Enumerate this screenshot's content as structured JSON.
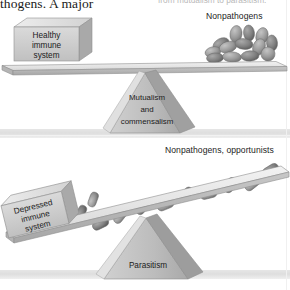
{
  "figure": {
    "caption_left": "thogens. A major",
    "caption_right": "from mutualism to parasitism."
  },
  "panels": [
    {
      "id": "panel-top",
      "state": "balanced",
      "left_block": {
        "lines": [
          "Healthy",
          "immune",
          "system"
        ],
        "text": "Healthy immune system"
      },
      "right_label": "Nonpathogens",
      "fulcrum": {
        "lines": [
          "Mutualism",
          "and",
          "commensalism"
        ],
        "text": "Mutualism and commensalism"
      },
      "microbes": {
        "shape": "coccobacilli-pile",
        "count": 13
      }
    },
    {
      "id": "panel-bottom",
      "state": "tipped-left",
      "left_block": {
        "lines": [
          "Depressed",
          "immune",
          "system"
        ],
        "text": "Depressed immune system"
      },
      "right_label": "Nonpathogens, opportunists",
      "fulcrum": {
        "lines": [
          "Parasitism"
        ],
        "text": "Parasitism"
      },
      "microbes": {
        "shape": "bacilli-rods",
        "count": 11
      }
    }
  ],
  "colors": {
    "block_face": "#c9c9c9",
    "block_top": "#e2e2e2",
    "block_side": "#a8a8a8",
    "plank": "#d4d4d4",
    "plank_top": "#ececec",
    "plank_edge": "#9a9a9a",
    "fulcrum": "#b6b6b6",
    "fulcrum_shade": "#8e8e8e",
    "microbe": "#9c9c9c",
    "microbe_dark": "#6f6f6f",
    "ground": "#e4e4e4",
    "text": "#1d1d1d",
    "faded_text": "#b9b9b9"
  }
}
